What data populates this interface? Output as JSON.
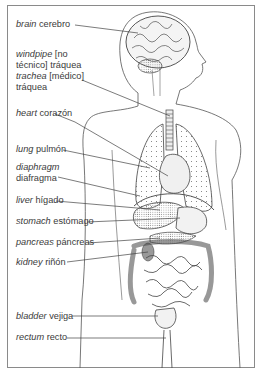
{
  "diagram": {
    "labels": [
      {
        "id": "brain",
        "en": "brain",
        "es": "cerebro",
        "y": 25
      },
      {
        "id": "windpipe",
        "en": "windpipe",
        "es_pre": "[no",
        "line2": "técnico] tráquea",
        "y": 55
      },
      {
        "id": "trachea",
        "en": "trachea",
        "es_pre": "[médico]",
        "line2": "tráquea",
        "y": 77
      },
      {
        "id": "heart",
        "en": "heart",
        "es": "corazón",
        "y": 112
      },
      {
        "id": "lung",
        "en": "lung",
        "es": "pulmón",
        "y": 148
      },
      {
        "id": "diaphragm",
        "en": "diaphragm",
        "line2": "diafragma",
        "y": 166
      },
      {
        "id": "liver",
        "en": "liver",
        "es": "hígado",
        "y": 199
      },
      {
        "id": "stomach",
        "en": "stomach",
        "es": "estómago",
        "y": 220
      },
      {
        "id": "pancreas",
        "en": "pancreas",
        "es": "páncreas",
        "y": 242
      },
      {
        "id": "kidney",
        "en": "kidney",
        "es": "riñón",
        "y": 262
      },
      {
        "id": "bladder",
        "en": "bladder",
        "es": "vejiga",
        "y": 315
      },
      {
        "id": "rectum",
        "en": "rectum",
        "es": "recto",
        "y": 337
      }
    ],
    "colors": {
      "line": "#444444",
      "text": "#3a3a3a",
      "frame": "#8a8a8a"
    }
  }
}
